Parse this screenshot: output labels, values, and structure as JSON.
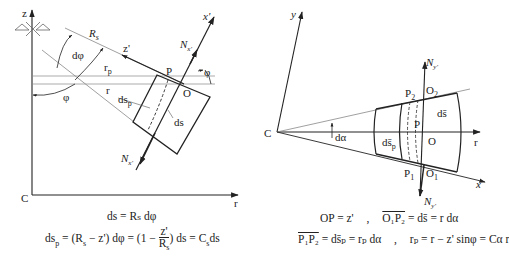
{
  "left_diagram": {
    "axes": {
      "z": "z",
      "r": "r",
      "origin": "C"
    },
    "labels": {
      "Rs": "R",
      "Rs_sub": "s",
      "dphi": "dφ",
      "rp": "r",
      "rp_sub": "p",
      "r": "r",
      "phi_left": "φ",
      "phi_right": "φ",
      "z_prime": "z'",
      "x_prime": "x'",
      "P": "P",
      "O": "O",
      "dsp": "ds",
      "dsp_sub": "p",
      "ds": "ds",
      "Nx_top": "N",
      "Nx_top_sub": "x'",
      "Nx_bottom": "N",
      "Nx_bottom_sub": "x'"
    },
    "equations": {
      "line1": "ds = Rₛ dφ",
      "line2_a": "ds",
      "line2_a_sub": "p",
      "line2_b": " = (R",
      "line2_c": "s",
      "line2_d": " − z') dφ = (1 − ",
      "frac_num": "z'",
      "frac_den": "R",
      "frac_den_sub": "s",
      "line2_e": ") ds = C",
      "line2_f": "s",
      "line2_g": "ds"
    }
  },
  "right_diagram": {
    "axes": {
      "y": "y",
      "x": "x",
      "r": "r",
      "origin": "C"
    },
    "labels": {
      "dalpha": "dα",
      "Ny_top": "N",
      "Ny_top_sub": "y'",
      "Ny_bottom": "N",
      "Ny_bottom_sub": "y'",
      "P1": "P",
      "P1_sub": "1",
      "P2": "P",
      "P2_sub": "2",
      "O1": "O",
      "O1_sub": "1",
      "O2": "O",
      "O2_sub": "2",
      "P": "P",
      "O": "O",
      "ds_bar": "ds̄",
      "dsp_bar": "ds̄",
      "dsp_bar_sub": "p"
    },
    "equations": {
      "row1_left": "OP = z'",
      "sep": ",",
      "row1_right_over": "O₁P₂",
      "row1_right_rest": " = ds̄ = r dα",
      "row2_left_over": "P₁P₂",
      "row2_left_rest": " = ds̄ₚ = rₚ dα",
      "row2_right": "rₚ = r − z' sinφ = Cα r"
    }
  }
}
